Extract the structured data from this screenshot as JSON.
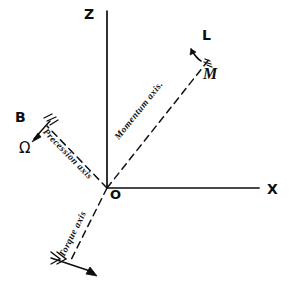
{
  "figure": {
    "background_color": "#ffffff",
    "ink_color": "#0d0d0d",
    "width": 289,
    "height": 294
  },
  "axes": {
    "z": {
      "label": "Z",
      "style": "solid",
      "description": "vertical axis pointing up from origin"
    },
    "x": {
      "label": "X",
      "style": "solid",
      "description": "horizontal axis pointing right from origin"
    },
    "origin": {
      "label": "O"
    },
    "momentum": {
      "label": "Momentum axis.",
      "style": "dashed",
      "direction": "up-right",
      "vector_head_label": "L",
      "magnitude_label": "M"
    },
    "precession": {
      "label": "Precession axis",
      "style": "dashed",
      "direction": "up-left",
      "vector_head_label": "B",
      "magnitude_label": "Ω"
    },
    "torque": {
      "label": "Torque axis",
      "style": "dashed",
      "direction": "down-left",
      "vector_head_label": "",
      "magnitude_label": ""
    }
  }
}
